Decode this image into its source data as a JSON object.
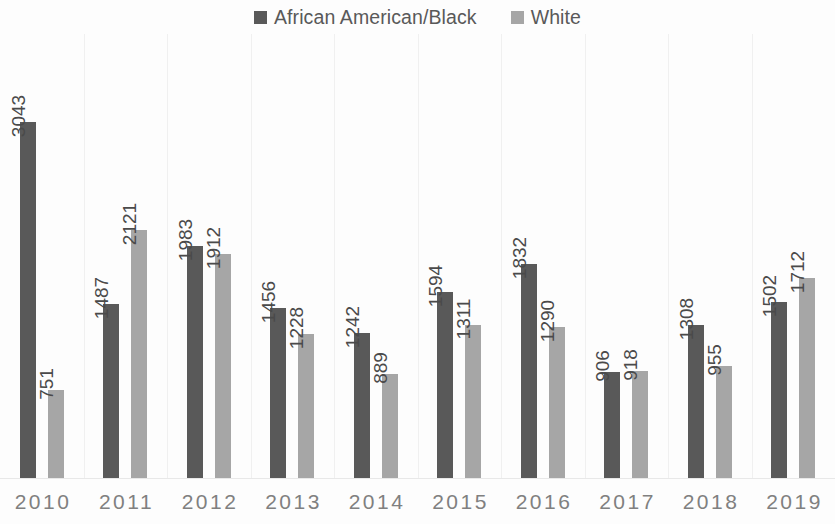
{
  "legend": {
    "position": "top-center",
    "entries": [
      {
        "label": "African American/Black",
        "color": "#595959",
        "swatch": "square-swatch"
      },
      {
        "label": "White",
        "color": "#a6a6a6",
        "swatch": "square-swatch"
      }
    ]
  },
  "chart_data": {
    "type": "bar",
    "title": "",
    "subtitle": "",
    "xlabel": "",
    "ylabel": "",
    "ylim": [
      0,
      3043
    ],
    "grid": false,
    "legend_position": "top-center",
    "categories": [
      "2010",
      "2011",
      "2012",
      "2013",
      "2014",
      "2015",
      "2016",
      "2017",
      "2018",
      "2019"
    ],
    "series": [
      {
        "name": "African American/Black",
        "color": "#595959",
        "values": [
          3043,
          1487,
          1983,
          1456,
          1242,
          1594,
          1832,
          906,
          1308,
          1502
        ]
      },
      {
        "name": "White",
        "color": "#a6a6a6",
        "values": [
          751,
          2121,
          1912,
          1228,
          889,
          1311,
          1290,
          918,
          955,
          1712
        ]
      }
    ],
    "data_labels": [
      {
        "category": "2010",
        "black": "3043",
        "white": "751"
      },
      {
        "category": "2011",
        "black": "1487",
        "white": "2121"
      },
      {
        "category": "2012",
        "black": "1983",
        "white": "1912"
      },
      {
        "category": "2013",
        "black": "1456",
        "white": "1228"
      },
      {
        "category": "2014",
        "black": "1242",
        "white": "889"
      },
      {
        "category": "2015",
        "black": "1594",
        "white": "1311"
      },
      {
        "category": "2016",
        "black": "1832",
        "white": "1290"
      },
      {
        "category": "2017",
        "black": "906",
        "white": "918"
      },
      {
        "category": "2018",
        "black": "1308",
        "white": "955"
      },
      {
        "category": "2019",
        "black": "1502",
        "white": "1712"
      }
    ]
  }
}
